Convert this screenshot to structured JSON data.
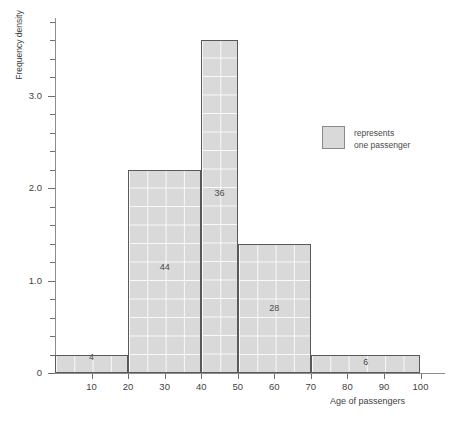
{
  "chart_data": {
    "type": "bar",
    "title": "",
    "xlabel": "Age of passengers",
    "ylabel": "Frequency density",
    "xlim": [
      0,
      100
    ],
    "ylim": [
      0,
      3.85
    ],
    "grid": true,
    "bin_edges": [
      0,
      20,
      40,
      50,
      70,
      100
    ],
    "bars": [
      {
        "start": 0,
        "end": 20,
        "density": 0.2,
        "label": "4"
      },
      {
        "start": 20,
        "end": 40,
        "density": 2.2,
        "label": "44"
      },
      {
        "start": 40,
        "end": 50,
        "density": 3.6,
        "label": "36"
      },
      {
        "start": 50,
        "end": 70,
        "density": 1.4,
        "label": "28"
      },
      {
        "start": 70,
        "end": 100,
        "density": 0.2,
        "label": "6"
      }
    ],
    "categories": [
      "0-20",
      "20-40",
      "40-50",
      "50-70",
      "70-100"
    ],
    "values": [
      0.2,
      2.2,
      3.6,
      1.4,
      0.2
    ],
    "frequencies": [
      4,
      44,
      36,
      28,
      6
    ],
    "xticks": [
      10,
      20,
      30,
      40,
      50,
      60,
      70,
      80,
      90,
      100
    ],
    "xtick_labels": [
      "10",
      "20",
      "30",
      "40",
      "50",
      "60",
      "70",
      "80",
      "90",
      "100"
    ],
    "yticks": [
      0,
      1.0,
      2.0,
      3.0
    ],
    "ytick_labels": [
      "0",
      "1.0",
      "2.0",
      "3.0"
    ],
    "yminor_step": 0.2,
    "legend": {
      "position": "right-upper",
      "swatch_color": "#d9d9d9",
      "text": "represents\none passenger"
    },
    "colors": {
      "bar_fill": "#d9d9d9",
      "bar_stroke": "#595959",
      "axis": "#8c8c8c",
      "text": "#4a4a4a"
    }
  }
}
